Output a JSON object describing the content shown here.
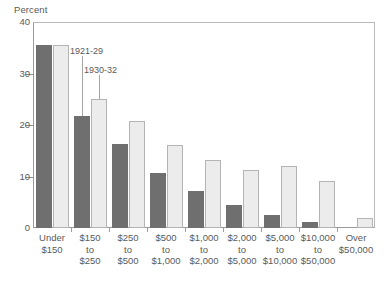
{
  "chart_data": {
    "type": "bar",
    "title": "",
    "ylabel": "Percent",
    "xlabel": "",
    "ylim": [
      0,
      40
    ],
    "yticks": [
      0,
      10,
      20,
      30,
      40
    ],
    "ytick_labels": [
      "0",
      "10",
      "20",
      "30",
      "40"
    ],
    "grid": false,
    "legend_position": "annotated-callouts",
    "categories": [
      "Under $150",
      "$150 to $250",
      "$250 to $500",
      "$500 to $1,000",
      "$1,000 to $2,000",
      "$2,000 to $5,000",
      "$5,000 to $10,000",
      "$10,000 to $50,000",
      "Over $50,000"
    ],
    "category_lines": [
      [
        "Under",
        "$150"
      ],
      [
        "$150",
        "to",
        "$250"
      ],
      [
        "$250",
        "to",
        "$500"
      ],
      [
        "$500",
        "to",
        "$1,000"
      ],
      [
        "$1,000",
        "to",
        "$2,000"
      ],
      [
        "$2,000",
        "to",
        "$5,000"
      ],
      [
        "$5,000",
        "to",
        "$10,000"
      ],
      [
        "$10,000",
        "to",
        "$50,000"
      ],
      [
        "Over",
        "$50,000"
      ]
    ],
    "series": [
      {
        "name": "1921-29",
        "color": "#6f6f6f",
        "values": [
          35.5,
          21.8,
          16.3,
          10.6,
          7.2,
          4.5,
          2.5,
          1.2,
          0.0
        ]
      },
      {
        "name": "1930-32",
        "color": "#ececec",
        "values": [
          35.5,
          25.0,
          20.7,
          16.2,
          13.2,
          11.3,
          12.0,
          9.1,
          1.9
        ]
      }
    ],
    "annotations": [
      {
        "text": "1921-29",
        "points_to_series": "1921-29",
        "points_to_category": "$150 to $250"
      },
      {
        "text": "1930-32",
        "points_to_series": "1930-32",
        "points_to_category": "$150 to $250"
      }
    ]
  },
  "axis": {
    "y_title": "Percent"
  },
  "footnote": {
    "text": ""
  }
}
